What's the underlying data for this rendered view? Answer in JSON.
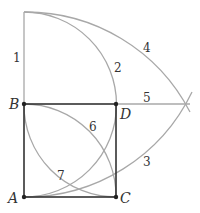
{
  "diagram": {
    "title": "",
    "points": {
      "A": {
        "label": "A",
        "x": 24,
        "y": 197
      },
      "B": {
        "label": "B",
        "x": 24,
        "y": 104
      },
      "C": {
        "label": "C",
        "x": 116,
        "y": 197
      },
      "D": {
        "label": "D",
        "x": 116,
        "y": 104
      }
    },
    "segment_labels": {
      "l1": "1",
      "l2": "2",
      "l3": "3",
      "l4": "4",
      "l5": "5",
      "l6": "6",
      "l7": "7"
    },
    "colors": {
      "square": "#333333",
      "construction": "#a8a8a8",
      "text": "#333333"
    }
  }
}
